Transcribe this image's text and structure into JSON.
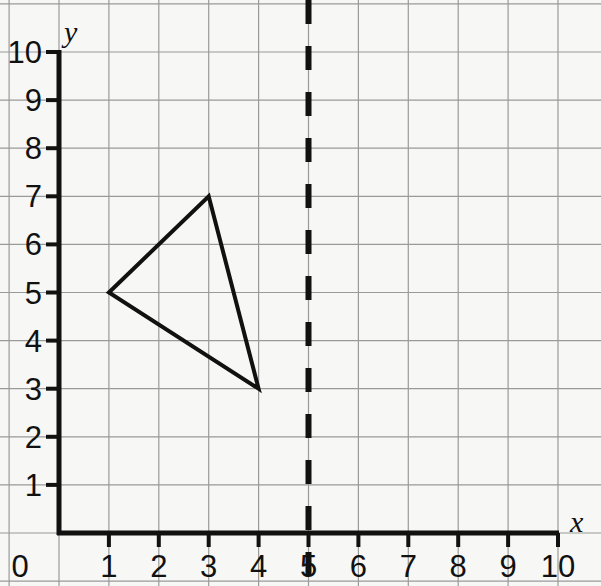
{
  "figure": {
    "kind": "coordinate-grid",
    "width": 601,
    "height": 586,
    "background_color": "#f7f7f5",
    "grid_color": "#9a9a9a",
    "ink_color": "#111111"
  },
  "axes": {
    "x_label": "x",
    "y_label": "y",
    "x_ticks": [
      "0",
      "1",
      "2",
      "3",
      "4",
      "5",
      "6",
      "7",
      "8",
      "9",
      "10"
    ],
    "y_ticks": [
      "1",
      "2",
      "3",
      "4",
      "5",
      "6",
      "7",
      "8",
      "9",
      "10"
    ],
    "x_range": [
      0,
      10
    ],
    "y_range": [
      0,
      10
    ],
    "origin_label": "0"
  },
  "chart_data": {
    "type": "scatter",
    "title": "",
    "xlabel": "x",
    "ylabel": "y",
    "xlim": [
      0,
      10
    ],
    "ylim": [
      0,
      10
    ],
    "grid": true,
    "legend": "none",
    "x_ticks": [
      0,
      1,
      2,
      3,
      4,
      5,
      6,
      7,
      8,
      9,
      10
    ],
    "y_ticks": [
      0,
      1,
      2,
      3,
      4,
      5,
      6,
      7,
      8,
      9,
      10
    ],
    "shapes": [
      {
        "name": "triangle",
        "kind": "polygon",
        "closed": true,
        "filled": false,
        "stroke_color": "#111111",
        "stroke_width": 4,
        "vertices": [
          {
            "label": "A",
            "x": 1,
            "y": 5
          },
          {
            "label": "B",
            "x": 3,
            "y": 7
          },
          {
            "label": "C",
            "x": 4,
            "y": 3
          }
        ]
      }
    ],
    "reference_lines": [
      {
        "name": "line-of-reflection",
        "orientation": "vertical",
        "equation": "x = 5",
        "x": 5,
        "style": "dashed",
        "stroke_color": "#111111",
        "stroke_width": 6,
        "dash_length": 24,
        "gap_length": 22
      }
    ]
  }
}
